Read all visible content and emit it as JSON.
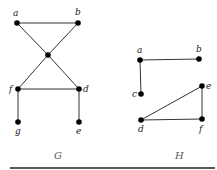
{
  "graphs": [
    {
      "name": "G",
      "caption": {
        "text": "G",
        "x": 54,
        "y": 159
      },
      "nodes": [
        {
          "id": "a",
          "x": 17,
          "y": 23,
          "label": "a",
          "lx": 13,
          "ly": 16
        },
        {
          "id": "b",
          "x": 78,
          "y": 23,
          "label": "b",
          "lx": 75,
          "ly": 15
        },
        {
          "id": "center",
          "x": 48,
          "y": 55,
          "label": "",
          "lx": 0,
          "ly": 0
        },
        {
          "id": "f",
          "x": 18,
          "y": 89,
          "label": "f",
          "lx": 9,
          "ly": 92
        },
        {
          "id": "d",
          "x": 79,
          "y": 89,
          "label": "d",
          "lx": 83,
          "ly": 92
        },
        {
          "id": "g",
          "x": 18,
          "y": 122,
          "label": "g",
          "lx": 15,
          "ly": 134
        },
        {
          "id": "e",
          "x": 79,
          "y": 122,
          "label": "e",
          "lx": 76,
          "ly": 134
        }
      ],
      "edges": [
        [
          "a",
          "b"
        ],
        [
          "a",
          "center"
        ],
        [
          "b",
          "center"
        ],
        [
          "center",
          "f"
        ],
        [
          "center",
          "d"
        ],
        [
          "f",
          "d"
        ],
        [
          "f",
          "g"
        ],
        [
          "d",
          "e"
        ]
      ]
    },
    {
      "name": "H",
      "caption": {
        "text": "H",
        "x": 175,
        "y": 159
      },
      "nodes": [
        {
          "id": "a",
          "x": 140,
          "y": 60,
          "label": "a",
          "lx": 137,
          "ly": 53
        },
        {
          "id": "b",
          "x": 199,
          "y": 59,
          "label": "b",
          "lx": 196,
          "ly": 52
        },
        {
          "id": "c",
          "x": 141,
          "y": 94,
          "label": "c",
          "lx": 132,
          "ly": 97
        },
        {
          "id": "e",
          "x": 202,
          "y": 86,
          "label": "e",
          "lx": 206,
          "ly": 89
        },
        {
          "id": "d",
          "x": 141,
          "y": 120,
          "label": "d",
          "lx": 138,
          "ly": 132
        },
        {
          "id": "f",
          "x": 202,
          "y": 119,
          "label": "f",
          "lx": 199,
          "ly": 132
        }
      ],
      "edges": [
        [
          "a",
          "b"
        ],
        [
          "a",
          "c"
        ],
        [
          "d",
          "e"
        ],
        [
          "d",
          "f"
        ],
        [
          "e",
          "f"
        ]
      ]
    }
  ],
  "baseline": {
    "x1": 10,
    "x2": 215,
    "y": 168
  }
}
